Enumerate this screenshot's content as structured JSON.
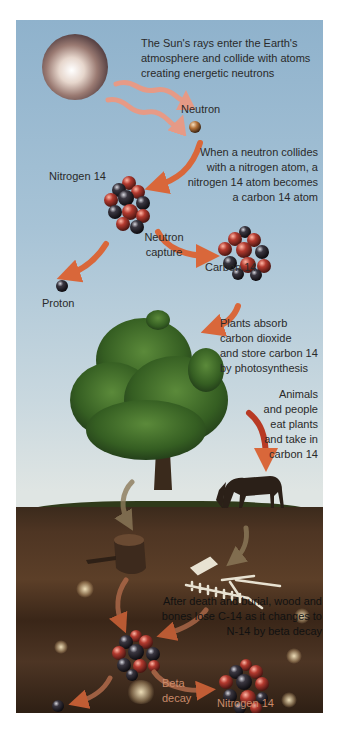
{
  "diagram": {
    "title_text": "The Sun's rays enter the Earth's atmosphere and collide with atoms creating energetic neutrons",
    "sun_text_lines": [
      "The Sun's rays enter the Earth's",
      "atmosphere and collide with atoms",
      "creating energetic neutrons"
    ],
    "labels": {
      "neutron": "Neutron",
      "nitrogen14_top": "Nitrogen 14",
      "carbon14": "Carbon 14",
      "proton": "Proton",
      "neutron_capture_1": "Neutron",
      "neutron_capture_2": "capture",
      "beta_decay_1": "Beta",
      "beta_decay_2": "decay",
      "nitrogen14_bottom": "Nitrogen 14"
    },
    "collision_text_lines": [
      "When a neutron collides",
      "with a nitrogen atom, a",
      "nitrogen 14 atom becomes",
      "a carbon 14 atom"
    ],
    "plants_text_lines": [
      "Plants absorb",
      "carbon dioxide",
      "and store carbon 14",
      "by photosynthesis"
    ],
    "animals_text_lines": [
      "Animals",
      "and people",
      "eat plants",
      "and take in",
      "carbon 14"
    ],
    "decay_text_lines": [
      "After death and burial, wood and",
      "bones lose C-14 as it changes to",
      "N-14 by beta decay"
    ],
    "colors": {
      "sky_top": "#8fb2cc",
      "sky_bottom": "#dfe5e3",
      "arrow": "#d9673a",
      "arrow_wave": "#e69a86",
      "tree": "#3f6b2a",
      "soil": "#4e3523",
      "atom_red": "#a3322a",
      "atom_dark": "#2a2426"
    }
  }
}
